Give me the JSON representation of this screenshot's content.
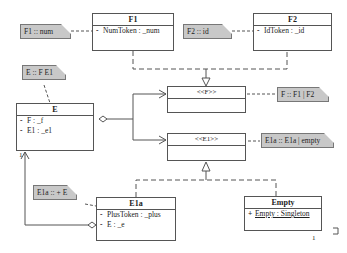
{
  "classes": {
    "F1": {
      "name": "F1",
      "attrs": [
        {
          "vis": "-",
          "text": "NumToken : _num"
        }
      ]
    },
    "F2": {
      "name": "F2",
      "attrs": [
        {
          "vis": "-",
          "text": "IdToken : _id"
        }
      ]
    },
    "E": {
      "name": "E",
      "attrs": [
        {
          "vis": "-",
          "text": "F : _f"
        },
        {
          "vis": "-",
          "text": "E1 : _e1"
        }
      ]
    },
    "F": {
      "name": "<<F>>"
    },
    "E1": {
      "name": "<<E1>>"
    },
    "E1a": {
      "name": "E1a",
      "attrs": [
        {
          "vis": "-",
          "text": "PlusToken : _plus"
        },
        {
          "vis": "-",
          "text": "E : _e"
        }
      ]
    },
    "Empty": {
      "name": "Empty",
      "attrs": [
        {
          "vis": "+",
          "text": "Empty : Singleton"
        }
      ]
    }
  },
  "notes": {
    "f1": "F1 :: num",
    "f2": "F2 :: id",
    "e": "E :: F E1",
    "f": "F :: F1 | F2",
    "e1": "E1a :: E1a | empty",
    "e1a": "E1a :: + E"
  },
  "multiplicities": {
    "e_self": "1",
    "empty_self": "1"
  }
}
